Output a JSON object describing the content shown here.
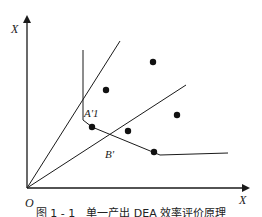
{
  "figure": {
    "axes": {
      "y_label": "X",
      "x_label": "X",
      "origin_label": "O"
    },
    "points": {
      "A1_label": "A'1",
      "B_label": "B'"
    },
    "caption": "图 1 - 1　单一产出 DEA 效率评价原理"
  },
  "colors": {
    "line": "#1a1a1a",
    "background": "#ffffff"
  }
}
